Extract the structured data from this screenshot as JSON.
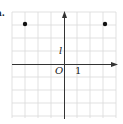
{
  "figure": {
    "part_label": "a.",
    "origin_label": "O",
    "unit_label": "1",
    "y_unit_label": "l",
    "grid": {
      "x_min": -4,
      "x_max": 4,
      "y_min": -4,
      "y_max": 4,
      "step": 1
    },
    "points": [
      {
        "x": -3,
        "y": 3
      },
      {
        "x": 3,
        "y": 3
      }
    ],
    "colors": {
      "grid": "#d9d9d9",
      "axis": "#333333",
      "point": "#111111"
    }
  }
}
